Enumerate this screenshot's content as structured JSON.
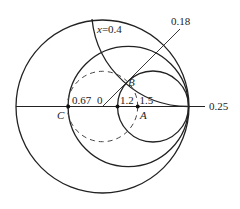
{
  "diagram": {
    "type": "smith-chart",
    "colors": {
      "line": "#222222",
      "background": "#ffffff"
    },
    "labels": {
      "reactance": "x=0.4",
      "wavelength_b": "0.18",
      "wavelength_axis": "0.25",
      "r_c": "0.67",
      "origin": "0",
      "r_1_2": "1.2",
      "r_1_5": "1.5",
      "point_a": "A",
      "point_b": "B",
      "point_c": "C"
    }
  }
}
